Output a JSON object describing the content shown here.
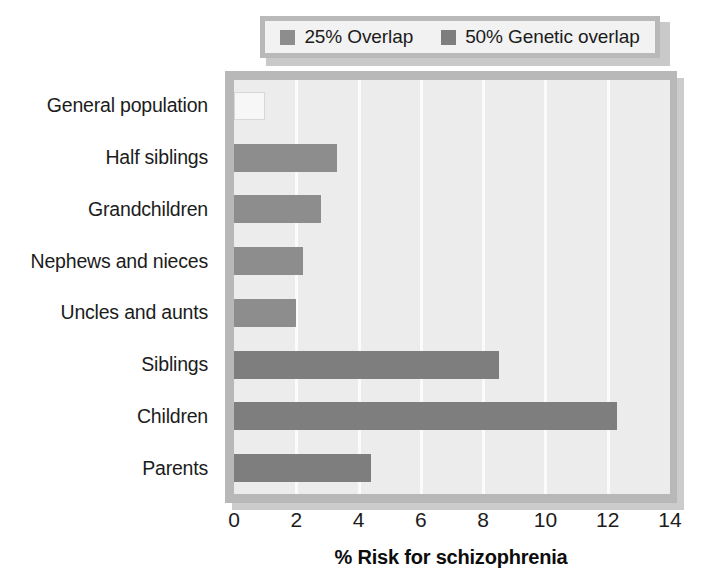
{
  "chart_data": {
    "type": "bar",
    "orientation": "horizontal",
    "title": "",
    "xlabel": "% Risk for schizophrenia",
    "ylabel": "",
    "xlim": [
      0,
      14
    ],
    "xticks": [
      0,
      2,
      4,
      6,
      8,
      10,
      12,
      14
    ],
    "grid": true,
    "categories": [
      "General population",
      "Half siblings",
      "Grandchildren",
      "Nephews and nieces",
      "Uncles and aunts",
      "Siblings",
      "Children",
      "Parents"
    ],
    "values": [
      1.0,
      3.3,
      2.8,
      2.2,
      2.0,
      8.5,
      12.3,
      4.4
    ],
    "group_of_bar": [
      "none",
      "25% Overlap",
      "25% Overlap",
      "25% Overlap",
      "25% Overlap",
      "50% Genetic overlap",
      "50% Genetic overlap",
      "50% Genetic overlap"
    ],
    "legend": {
      "position": "top",
      "entries": [
        {
          "label": "25% Overlap",
          "color": "#8d8d8d"
        },
        {
          "label": "50% Genetic overlap",
          "color": "#7e7e7e"
        }
      ]
    },
    "colors": {
      "bar_light": "#8d8d8d",
      "bar_dark": "#7e7e7e",
      "bar_empty": "#f7f7f7",
      "plot_background": "#ececec",
      "frame": "#b8b8b8",
      "shadow": "#cccccc",
      "gridline": "#fbfbfb",
      "text": "#1c1c1c"
    }
  }
}
